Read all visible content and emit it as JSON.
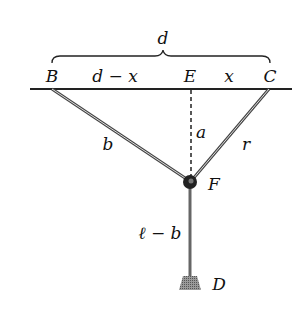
{
  "labels": {
    "d": "d",
    "B": "B",
    "d_minus_x": "d − x",
    "E": "E",
    "x": "x",
    "C": "C",
    "a": "a",
    "b": "b",
    "r": "r",
    "F": "F",
    "l_minus_b": "ℓ − b",
    "D": "D"
  },
  "colors": {
    "line": "#222222",
    "rod": "#555555",
    "weight": "#8a8a8a"
  }
}
